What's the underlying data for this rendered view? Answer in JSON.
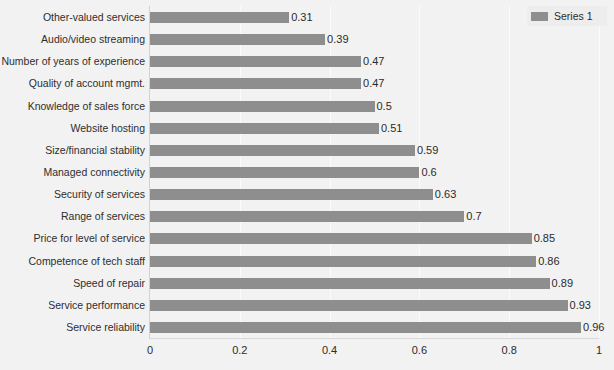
{
  "chart_data": {
    "type": "bar",
    "orientation": "horizontal",
    "title": "",
    "subtitle": "",
    "xlabel": "",
    "ylabel": "",
    "xlim": [
      0,
      1
    ],
    "grid": true,
    "grid_axis": "x",
    "legend_position": "top-right",
    "bar_color": "#8e8e8e",
    "plot_background": "#f2f2f2",
    "xticks": [
      "0",
      "0.2",
      "0.4",
      "0.6",
      "0.8",
      "1"
    ],
    "xtick_values": [
      0,
      0.2,
      0.4,
      0.6,
      0.8,
      1
    ],
    "categories": [
      "Other-valued services",
      "Audio/video streaming",
      "Number of years of experience",
      "Quality of account mgmt.",
      "Knowledge of sales force",
      "Website hosting",
      "Size/financial stability",
      "Managed connectivity",
      "Security of services",
      "Range of services",
      "Price for level of service",
      "Competence of tech staff",
      "Speed of repair",
      "Service performance",
      "Service reliability"
    ],
    "values": [
      0.31,
      0.39,
      0.47,
      0.47,
      0.5,
      0.51,
      0.59,
      0.6,
      0.63,
      0.7,
      0.85,
      0.86,
      0.89,
      0.93,
      0.96
    ],
    "value_labels": [
      "0.31",
      "0.39",
      "0.47",
      "0.47",
      "0.5",
      "0.51",
      "0.59",
      "0.6",
      "0.63",
      "0.7",
      "0.85",
      "0.86",
      "0.89",
      "0.93",
      "0.96"
    ],
    "series": [
      {
        "name": "Series 1",
        "values": [
          0.31,
          0.39,
          0.47,
          0.47,
          0.5,
          0.51,
          0.59,
          0.6,
          0.63,
          0.7,
          0.85,
          0.86,
          0.89,
          0.93,
          0.96
        ]
      }
    ]
  },
  "legend": {
    "entries": [
      {
        "label": "Series 1",
        "color": "#8e8e8e"
      }
    ]
  }
}
